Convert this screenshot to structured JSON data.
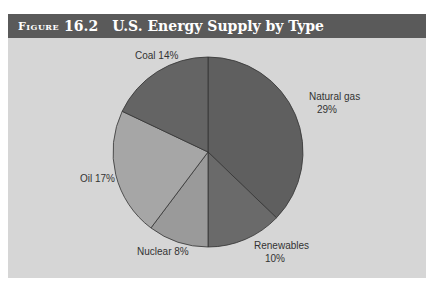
{
  "header": {
    "figure_label": "Figure",
    "figure_number": "16.2",
    "title": "U.S. Energy Supply by Type"
  },
  "colors": {
    "natural_gas": "#5f5f5f",
    "renewables": "#6a6a6a",
    "nuclear": "#9a9a9a",
    "oil": "#a6a6a6",
    "coal": "#646464",
    "background": "#d6d6d6",
    "titlebar": "#5a5a5a"
  },
  "chart_data": {
    "type": "pie",
    "title": "U.S. Energy Supply by Type",
    "categories": [
      "Natural gas",
      "Renewables",
      "Nuclear",
      "Oil",
      "Coal"
    ],
    "values": [
      29,
      10,
      8,
      17,
      14
    ],
    "unit": "%",
    "labels": {
      "natural_gas": [
        "Natural gas",
        "29%"
      ],
      "renewables": [
        "Renewables",
        "10%"
      ],
      "nuclear": "Nuclear 8%",
      "oil": "Oil 17%",
      "coal": "Coal 14%"
    },
    "start_angle": "12 o'clock",
    "direction": "clockwise"
  }
}
